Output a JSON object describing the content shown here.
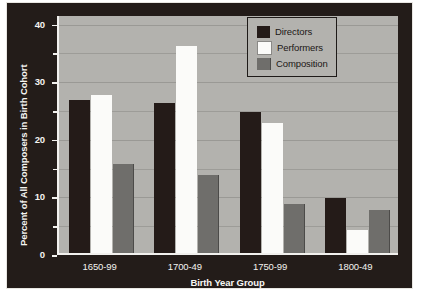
{
  "chart_data": {
    "type": "bar",
    "title": "",
    "xlabel": "Birth Year Group",
    "ylabel": "Percent of All Composers in Birth Cohort",
    "categories": [
      "1650-99",
      "1700-49",
      "1750-99",
      "1800-49"
    ],
    "series": [
      {
        "name": "Directors",
        "color": "#241b18",
        "values": [
          26.5,
          26.0,
          24.5,
          9.5
        ]
      },
      {
        "name": "Performers",
        "color": "#fbfbf9",
        "values": [
          27.5,
          36.0,
          22.5,
          4.0
        ]
      },
      {
        "name": "Composition",
        "color": "#6f6e6b",
        "values": [
          15.5,
          13.5,
          8.5,
          7.5
        ]
      }
    ],
    "ylim": [
      0,
      41.5
    ],
    "yticks": [
      0,
      10,
      20,
      30,
      40
    ],
    "ytick_labels": [
      "0",
      "10",
      "20",
      "30",
      "40"
    ],
    "yminor_ticks": [
      5,
      15,
      25,
      35
    ],
    "grid": true,
    "legend_position": "top-center-right",
    "plot_background": "#b3b2ae",
    "figure_background": "#231c19"
  },
  "legend": {
    "items": [
      {
        "label": "Directors"
      },
      {
        "label": "Performers"
      },
      {
        "label": "Composition"
      }
    ]
  }
}
